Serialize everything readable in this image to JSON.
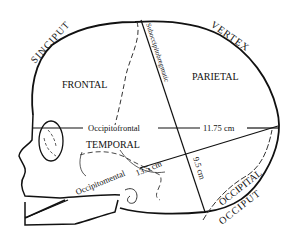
{
  "diagram": {
    "regions": {
      "frontal": "FRONTAL",
      "parietal": "PARIETAL",
      "temporal": "TEMPORAL",
      "occipital": "OCCIPITAL"
    },
    "outer_labels": {
      "sinciput": "SINCIPUT",
      "vertex": "VERTEX",
      "occiput": "OCCIPUT"
    },
    "diameters": {
      "occipitofrontal": {
        "label": "Occipitofrontal",
        "value": "11.75 cm"
      },
      "occipitomental": {
        "label": "Occipitomental",
        "value": "13.5 cm"
      },
      "suboccipitobregmatic": {
        "label": "Suboccipitobregmatic",
        "value": "9.5 cm"
      }
    },
    "colors": {
      "line": "#111111",
      "background": "#ffffff"
    }
  }
}
